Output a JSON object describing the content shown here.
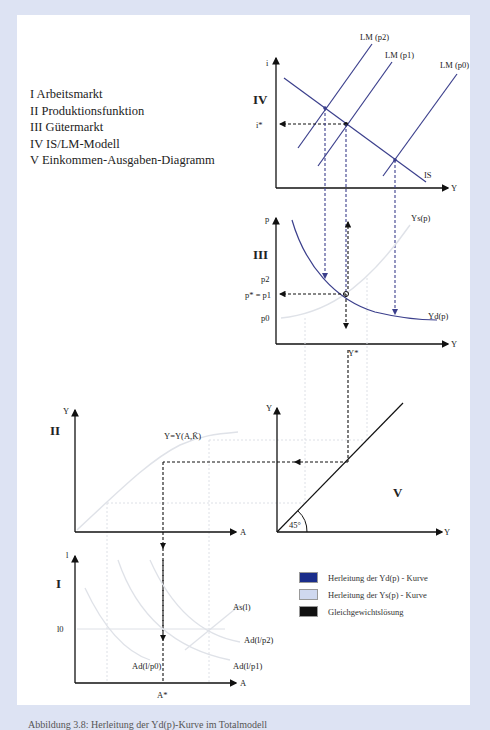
{
  "legend_list": [
    "I  Arbeitsmarkt",
    "II  Produktionsfunktion",
    "III Gütermarkt",
    "IV IS/LM-Modell",
    "V  Einkommen-Ausgaben-Diagramm"
  ],
  "panels": {
    "iv": {
      "roman": "IV",
      "y_axis": "i",
      "x_axis": "Y",
      "i_star": "i*",
      "curves": [
        "LM (p2)",
        "LM (p1)",
        "LM (p0)",
        "IS"
      ]
    },
    "iii": {
      "roman": "III",
      "y_axis": "p",
      "x_axis": "Y",
      "p2": "p2",
      "p_star": "p* = p1",
      "p0": "p0",
      "ys": "Ys(p)",
      "yd": "Yd(p)",
      "y_star": "Y*"
    },
    "ii": {
      "roman": "II",
      "y_axis": "Y",
      "x_axis": "A",
      "function": "Y=Y(A,K̄)"
    },
    "v": {
      "roman": "V",
      "y_axis": "Y",
      "x_axis": "Y",
      "angle": "45°"
    },
    "i": {
      "roman": "I",
      "y_axis": "l",
      "x_axis": "A",
      "l0": "l0",
      "as": "As(l)",
      "ad2": "Ad(l/p2)",
      "ad1": "Ad(l/p1)",
      "ad0": "Ad(l/p0)",
      "a_star": "A*"
    }
  },
  "key": [
    {
      "label": "Herleitung der Yd(p) - Kurve",
      "color": "#1a2d8a"
    },
    {
      "label": "Herleitung der Ys(p) - Kurve",
      "color": "#cfd8ef"
    },
    {
      "label": "Gleichgewichtslösung",
      "color": "#111111"
    }
  ],
  "colors": {
    "dark_blue": "#3b3f8c",
    "light": "#d9dde6",
    "black": "#111111",
    "frame": "#dde3f3"
  },
  "caption": "Abbildung 3.8: Herleitung der Yd(p)-Kurve im Totalmodell"
}
